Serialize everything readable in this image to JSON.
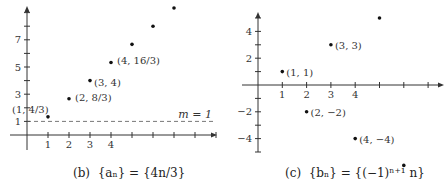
{
  "chart_data": [
    {
      "type": "scatter",
      "title": "(b) {a_n} = {4n/3}",
      "caption_prefix": "(b)",
      "caption_formula": "{aₙ} = {4n/3}",
      "xlabel": "",
      "ylabel": "",
      "x_tick_labels": [
        "1",
        "2",
        "3",
        "4"
      ],
      "y_tick_labels": [
        "1",
        "3",
        "5",
        "7"
      ],
      "xlim": [
        0,
        9
      ],
      "ylim": [
        0,
        9.5
      ],
      "grid": false,
      "points": [
        {
          "x": 1,
          "y": 1.333,
          "label": "(1, 4/3)"
        },
        {
          "x": 2,
          "y": 2.667,
          "label": "(2, 8/3)"
        },
        {
          "x": 3,
          "y": 4,
          "label": "(3, 4)"
        },
        {
          "x": 4,
          "y": 5.333,
          "label": "(4, 16/3)"
        },
        {
          "x": 5,
          "y": 6.667,
          "label": ""
        },
        {
          "x": 6,
          "y": 8,
          "label": ""
        },
        {
          "x": 7,
          "y": 9.333,
          "label": ""
        }
      ],
      "reference_line": {
        "y": 1,
        "label": "m = 1",
        "style": "dashed"
      }
    },
    {
      "type": "scatter",
      "title": "(c) {b_n} = {(-1)^(n+1) n}",
      "caption_prefix": "(c)",
      "caption_formula": "{bₙ} = {(−1)ⁿ⁺¹ n}",
      "xlabel": "",
      "ylabel": "",
      "x_tick_labels": [
        "1",
        "2",
        "3",
        "4"
      ],
      "y_tick_labels": [
        "4",
        "2",
        "−2",
        "−4"
      ],
      "xlim": [
        0,
        7.5
      ],
      "ylim": [
        -5.5,
        5.5
      ],
      "grid": false,
      "points": [
        {
          "x": 1,
          "y": 1,
          "label": "(1, 1)"
        },
        {
          "x": 2,
          "y": -2,
          "label": "(2, −2)"
        },
        {
          "x": 3,
          "y": 3,
          "label": "(3, 3)"
        },
        {
          "x": 4,
          "y": -4,
          "label": "(4, −4)"
        },
        {
          "x": 5,
          "y": 5,
          "label": ""
        },
        {
          "x": 6,
          "y": -6,
          "label": ""
        }
      ]
    }
  ]
}
